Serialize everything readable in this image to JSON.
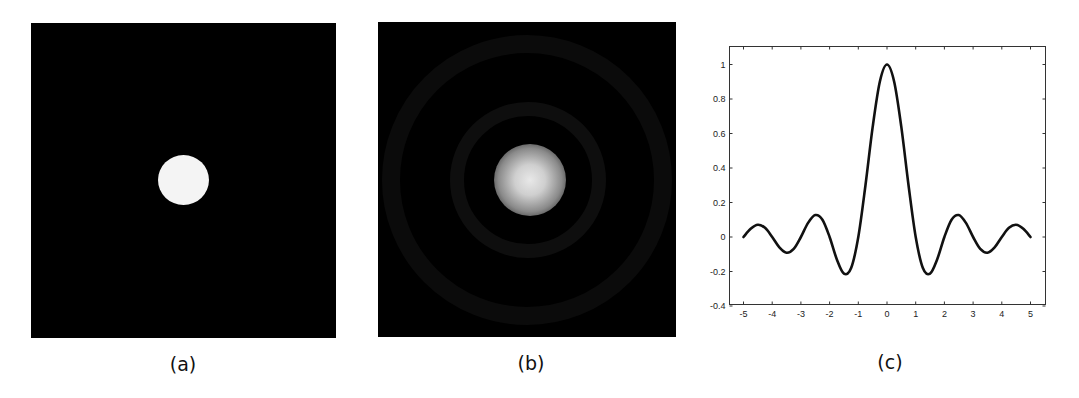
{
  "panels": [
    {
      "id": "a",
      "caption": "(a)",
      "description": "white filled circle on black background",
      "background": "#000000",
      "disk_color": "#f4f4f4"
    },
    {
      "id": "b",
      "caption": "(b)",
      "description": "blurred bright spot with faint concentric rings on black background",
      "background": "#000000"
    },
    {
      "id": "c",
      "caption": "(c)"
    }
  ],
  "chart_data": {
    "type": "line",
    "title": "",
    "xlabel": "",
    "ylabel": "",
    "xlim": [
      -5.5,
      5.5
    ],
    "ylim": [
      -0.4,
      1.1
    ],
    "grid": false,
    "legend": null,
    "x_ticks": [
      -5,
      -4,
      -3,
      -2,
      -1,
      0,
      1,
      2,
      3,
      4,
      5
    ],
    "y_ticks": [
      -0.4,
      -0.2,
      0,
      0.2,
      0.4,
      0.6,
      0.8,
      1
    ],
    "y_tick_labels": [
      "-0.4",
      "-0.2",
      "0",
      "0.2",
      "0.4",
      "0.6",
      "0.8",
      "1"
    ],
    "series": [
      {
        "name": "sinc(x)",
        "color": "#111111",
        "x": [
          -5,
          -4.75,
          -4.5,
          -4.25,
          -4,
          -3.75,
          -3.5,
          -3.25,
          -3,
          -2.75,
          -2.5,
          -2.25,
          -2,
          -1.75,
          -1.5,
          -1.25,
          -1,
          -0.75,
          -0.5,
          -0.25,
          0,
          0.25,
          0.5,
          0.75,
          1,
          1.25,
          1.5,
          1.75,
          2,
          2.25,
          2.5,
          2.75,
          3,
          3.25,
          3.5,
          3.75,
          4,
          4.25,
          4.5,
          4.75,
          5
        ],
        "y": [
          0,
          0.0474,
          0.0707,
          0.053,
          0,
          -0.06,
          -0.0909,
          -0.0693,
          0,
          0.0818,
          0.1273,
          0.1,
          0,
          -0.1286,
          -0.2122,
          -0.1801,
          0,
          0.3001,
          0.6366,
          0.9003,
          1,
          0.9003,
          0.6366,
          0.3001,
          0,
          -0.1801,
          -0.2122,
          -0.1286,
          0,
          0.1,
          0.1273,
          0.0818,
          0,
          -0.0693,
          -0.0909,
          -0.06,
          0,
          0.053,
          0.0707,
          0.0474,
          0
        ]
      }
    ]
  }
}
